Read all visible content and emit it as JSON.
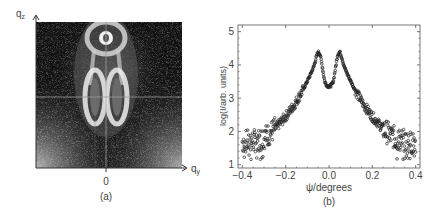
{
  "panel_a": {
    "caption": "(a)",
    "x_axis_label": "q",
    "x_axis_sub": "y",
    "y_axis_label": "q",
    "y_axis_sub": "z",
    "x_tick": "0"
  },
  "panel_b": {
    "caption": "(b)",
    "xlabel": "ψ/degrees",
    "ylabel": "log(I/arb. units)",
    "x_ticks": [
      "−0.4",
      "−0.2",
      "0.0",
      "0.2",
      "0.4"
    ],
    "y_ticks": [
      "1",
      "2",
      "3",
      "4",
      "5"
    ]
  },
  "chart_data": [
    {
      "type": "heatmap",
      "title": "(a)",
      "xlabel": "q_y",
      "ylabel": "q_z",
      "x_tick_labels": [
        "0"
      ],
      "description": "2D grazing-incidence scattering intensity map: bright lobe near top center, two elongated bright lobes symmetric about q_y=0 below it, crosshair lines through center, noisy speckled background brighter toward lower corners"
    },
    {
      "type": "scatter",
      "title": "(b)",
      "xlabel": "ψ/degrees",
      "ylabel": "log(I/arb. units)",
      "xlim": [
        -0.42,
        0.42
      ],
      "ylim": [
        0.9,
        5.2
      ],
      "x_ticks": [
        -0.4,
        -0.2,
        0.0,
        0.2,
        0.4
      ],
      "y_ticks": [
        1,
        2,
        3,
        4,
        5
      ],
      "grid": false,
      "marker": "open circle",
      "series": [
        {
          "name": "intensity",
          "x": [
            -0.4,
            -0.36,
            -0.32,
            -0.28,
            -0.24,
            -0.2,
            -0.16,
            -0.12,
            -0.09,
            -0.07,
            -0.06,
            -0.05,
            -0.04,
            -0.03,
            -0.02,
            -0.01,
            0.0,
            0.01,
            0.02,
            0.03,
            0.04,
            0.05,
            0.06,
            0.07,
            0.09,
            0.12,
            0.16,
            0.2,
            0.24,
            0.28,
            0.32,
            0.36,
            0.4
          ],
          "y": [
            1.7,
            1.7,
            1.75,
            1.9,
            2.15,
            2.45,
            2.8,
            3.25,
            3.65,
            3.95,
            4.2,
            4.4,
            4.3,
            3.9,
            3.5,
            3.38,
            3.35,
            3.38,
            3.5,
            3.9,
            4.3,
            4.4,
            4.2,
            3.95,
            3.65,
            3.25,
            2.8,
            2.45,
            2.15,
            1.9,
            1.75,
            1.7,
            1.6
          ]
        }
      ]
    }
  ]
}
